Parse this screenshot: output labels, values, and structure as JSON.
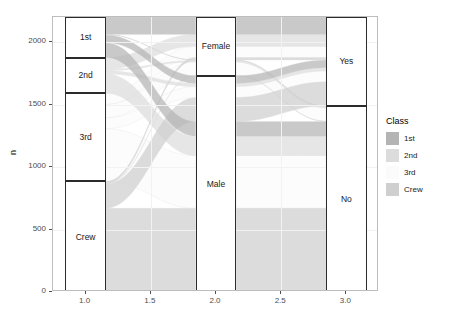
{
  "plot": {
    "type": "alluvial",
    "panel": {
      "background": "#ffffff",
      "border": "#bdbdbd",
      "grid": "#f2f2f2"
    }
  },
  "axes": {
    "y": {
      "title": "n",
      "ticks": [
        0,
        500,
        1000,
        1500,
        2000
      ],
      "tick_labels": [
        "0",
        "500",
        "1000",
        "1500",
        "2000"
      ],
      "range": [
        0,
        2201
      ]
    },
    "x": {
      "title": "",
      "ticks": [
        1.0,
        1.5,
        2.0,
        2.5,
        3.0
      ],
      "tick_labels": [
        "1.0",
        "1.5",
        "2.0",
        "2.5",
        "3.0"
      ],
      "range": [
        0.75,
        3.25
      ]
    }
  },
  "legend": {
    "title": "Class",
    "items": [
      {
        "label": "1st",
        "color": "#b4b4b4"
      },
      {
        "label": "2nd",
        "color": "#dcdcdc"
      },
      {
        "label": "3rd",
        "color": "#fbfbfb"
      },
      {
        "label": "Crew",
        "color": "#cfcfcf"
      }
    ]
  },
  "chart_data": {
    "type": "alluvial",
    "title": "",
    "xlabel": "",
    "ylabel": "n",
    "ylim": [
      0,
      2201
    ],
    "xlim": [
      0.75,
      3.25
    ],
    "grid": true,
    "legend_position": "right",
    "legend_title": "Class",
    "total": 2201,
    "axes_order": [
      "Class",
      "Sex",
      "Survived"
    ],
    "axis_positions": [
      1.0,
      2.0,
      3.0
    ],
    "strata": [
      {
        "axis": "Class",
        "x": 1.0,
        "nodes": [
          {
            "label": "1st",
            "value": 325,
            "y0": 1876,
            "y1": 2201
          },
          {
            "label": "2nd",
            "value": 285,
            "y0": 1591,
            "y1": 1876
          },
          {
            "label": "3rd",
            "value": 706,
            "y0": 885,
            "y1": 1591
          },
          {
            "label": "Crew",
            "value": 885,
            "y0": 0,
            "y1": 885
          }
        ]
      },
      {
        "axis": "Sex",
        "x": 2.0,
        "nodes": [
          {
            "label": "Female",
            "value": 470,
            "y0": 1731,
            "y1": 2201
          },
          {
            "label": "Male",
            "value": 1731,
            "y0": 0,
            "y1": 1731
          }
        ]
      },
      {
        "axis": "Survived",
        "x": 3.0,
        "nodes": [
          {
            "label": "Yes",
            "value": 711,
            "y0": 1490,
            "y1": 2201
          },
          {
            "label": "No",
            "value": 1490,
            "y0": 0,
            "y1": 1490
          }
        ]
      }
    ],
    "flows": [
      {
        "class": "1st",
        "sex": "Female",
        "survived": "Yes",
        "value": 141
      },
      {
        "class": "1st",
        "sex": "Female",
        "survived": "No",
        "value": 4
      },
      {
        "class": "1st",
        "sex": "Male",
        "survived": "Yes",
        "value": 62
      },
      {
        "class": "1st",
        "sex": "Male",
        "survived": "No",
        "value": 118
      },
      {
        "class": "2nd",
        "sex": "Female",
        "survived": "Yes",
        "value": 93
      },
      {
        "class": "2nd",
        "sex": "Female",
        "survived": "No",
        "value": 13
      },
      {
        "class": "2nd",
        "sex": "Male",
        "survived": "Yes",
        "value": 25
      },
      {
        "class": "2nd",
        "sex": "Male",
        "survived": "No",
        "value": 154
      },
      {
        "class": "3rd",
        "sex": "Female",
        "survived": "Yes",
        "value": 90
      },
      {
        "class": "3rd",
        "sex": "Female",
        "survived": "No",
        "value": 106
      },
      {
        "class": "3rd",
        "sex": "Male",
        "survived": "Yes",
        "value": 88
      },
      {
        "class": "3rd",
        "sex": "Male",
        "survived": "No",
        "value": 422
      },
      {
        "class": "Crew",
        "sex": "Female",
        "survived": "Yes",
        "value": 20
      },
      {
        "class": "Crew",
        "sex": "Female",
        "survived": "No",
        "value": 3
      },
      {
        "class": "Crew",
        "sex": "Male",
        "survived": "Yes",
        "value": 192
      },
      {
        "class": "Crew",
        "sex": "Male",
        "survived": "No",
        "value": 670
      }
    ]
  }
}
